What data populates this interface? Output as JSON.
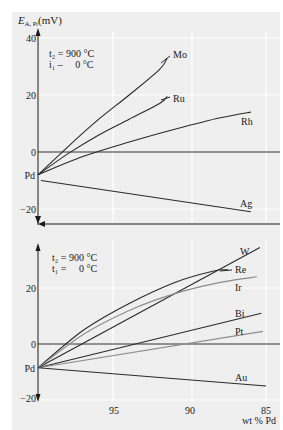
{
  "figure": {
    "background": "#efefef",
    "grid_color": "#ffffff",
    "axis_color": "#1a1a1a",
    "dark_line": "#2a2a2a",
    "light_line": "#8c8c8c"
  },
  "chart_data": [
    {
      "type": "line",
      "title": "",
      "ylabel": "E_A,Pt (mV)",
      "ylabel_main": "E",
      "ylabel_sub": "A, Pt",
      "ylabel_unit": "(mV)",
      "xlabel": "",
      "ylim": [
        -20,
        40
      ],
      "xlim": [
        100,
        85
      ],
      "yticks": [
        "40",
        "20",
        "0",
        "−20"
      ],
      "ytick_values": [
        40,
        20,
        0,
        -20
      ],
      "origin_label": "Pd",
      "annotation": {
        "line1": "t₂ = 900 °C",
        "line2": "i₁ –     0 °C"
      },
      "grid": true,
      "series": [
        {
          "name": "Mo",
          "style": "dark",
          "x": [
            100,
            98,
            96,
            94,
            92,
            91.5
          ],
          "y": [
            -8,
            2,
            11.5,
            20,
            29,
            33
          ]
        },
        {
          "name": "Ru",
          "style": "dark",
          "x": [
            100,
            98,
            96,
            94,
            92,
            91.5
          ],
          "y": [
            -8,
            -0.5,
            6,
            11.5,
            17,
            19.5
          ]
        },
        {
          "name": "Rh",
          "style": "dark",
          "x": [
            100,
            97,
            94,
            91,
            88,
            86
          ],
          "y": [
            -8,
            -1.5,
            3.5,
            8,
            12,
            14
          ]
        },
        {
          "name": "Ag",
          "style": "dark",
          "x": [
            99.8,
            86
          ],
          "y": [
            -10,
            -21
          ]
        }
      ]
    },
    {
      "type": "line",
      "title": "",
      "ylabel": "",
      "xlabel": "wt % Pd",
      "ylim": [
        -20,
        40
      ],
      "xlim": [
        100,
        85
      ],
      "xticks": [
        "95",
        "90",
        "85"
      ],
      "xtick_values": [
        95,
        90,
        85
      ],
      "yticks": [
        "20",
        "0",
        "−20"
      ],
      "ytick_values": [
        20,
        0,
        -20
      ],
      "origin_label": "Pd",
      "annotation": {
        "line1": "t₂ = 900 °C",
        "line2": "t₁ =     0 °C"
      },
      "grid": true,
      "series": [
        {
          "name": "W",
          "style": "dark",
          "x": [
            100,
            85.4
          ],
          "y": [
            -8.5,
            34.5
          ]
        },
        {
          "name": "Re",
          "style": "dark",
          "x": [
            100,
            97,
            94,
            91,
            88.5,
            87.5
          ],
          "y": [
            -8.5,
            5,
            14.5,
            22,
            26,
            26.5
          ]
        },
        {
          "name": "Ir",
          "style": "light",
          "x": [
            100,
            97,
            94,
            91,
            88,
            85.6
          ],
          "y": [
            -8.5,
            3.5,
            12,
            18,
            22,
            24
          ]
        },
        {
          "name": "Bi",
          "style": "dark",
          "x": [
            100,
            85.3
          ],
          "y": [
            -8.5,
            11
          ]
        },
        {
          "name": "Pt",
          "style": "light",
          "x": [
            100,
            85.2
          ],
          "y": [
            -8.5,
            4.5
          ]
        },
        {
          "name": "Au",
          "style": "dark",
          "x": [
            100,
            85
          ],
          "y": [
            -8.5,
            -15
          ]
        }
      ]
    }
  ]
}
